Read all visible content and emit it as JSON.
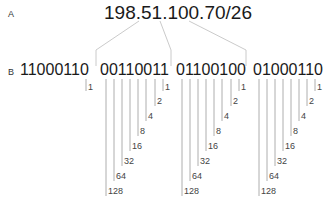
{
  "labels": {
    "a": "A",
    "b": "B"
  },
  "ip_address": "198.51.100.70/26",
  "octets": [
    {
      "binary": "11000110",
      "bits": [
        "1"
      ]
    },
    {
      "binary": "00110011",
      "bits": [
        "1",
        "2",
        "4",
        "8",
        "16",
        "32",
        "64",
        "128"
      ]
    },
    {
      "binary": "01100100",
      "bits": [
        "1",
        "2",
        "4",
        "8",
        "16",
        "32",
        "64",
        "128"
      ]
    },
    {
      "binary": "01000110",
      "bits": [
        "1",
        "2",
        "4",
        "8",
        "16",
        "32",
        "64",
        "128"
      ]
    }
  ],
  "colors": {
    "text": "#1a1a1a",
    "lines": "#9a9a9a",
    "connectors": "#c4c4c4"
  }
}
